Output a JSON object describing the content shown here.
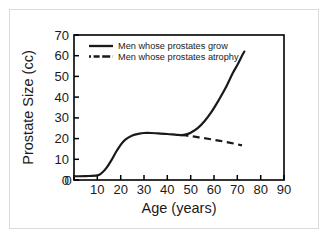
{
  "chart_data": {
    "type": "line",
    "title": "",
    "xlabel": "Age (years)",
    "ylabel": "Prostate Size (cc)",
    "xlim": [
      0,
      90
    ],
    "ylim": [
      0,
      70
    ],
    "xticks": [
      0,
      10,
      20,
      30,
      40,
      50,
      60,
      70,
      80,
      90
    ],
    "xtick_labels": [
      "0",
      "10",
      "20",
      "30",
      "40",
      "50",
      "60",
      "70",
      "80",
      "90"
    ],
    "yticks": [
      0,
      10,
      20,
      30,
      40,
      50,
      60,
      70
    ],
    "ytick_labels": [
      "0",
      "10",
      "20",
      "30",
      "40",
      "50",
      "60",
      "70"
    ],
    "grid": false,
    "legend_position": "top-left-inside",
    "series": [
      {
        "name": "Men whose prostates grow",
        "style": "solid",
        "color": "#1a1a1a",
        "x": [
          0,
          5,
          10,
          12,
          14,
          16,
          18,
          20,
          22,
          25,
          28,
          30,
          33,
          36,
          40,
          44,
          46,
          48,
          50,
          53,
          56,
          59,
          62,
          65,
          68,
          70,
          72,
          73
        ],
        "y": [
          1.8,
          1.9,
          2.2,
          3.5,
          6.0,
          9.5,
          13.5,
          17.0,
          19.5,
          21.5,
          22.4,
          22.7,
          22.7,
          22.5,
          22.2,
          21.8,
          21.7,
          22.0,
          22.8,
          25.0,
          28.5,
          33.0,
          38.5,
          44.5,
          51.5,
          55.5,
          60.0,
          62.0
        ]
      },
      {
        "name": "Men whose prostates atrophy",
        "style": "dashed",
        "color": "#1a1a1a",
        "x": [
          46,
          50,
          54,
          58,
          62,
          66,
          70,
          72
        ],
        "y": [
          21.7,
          21.2,
          20.5,
          19.8,
          19.0,
          18.2,
          17.2,
          16.7
        ]
      }
    ]
  },
  "legend": {
    "entries": [
      {
        "label": "Men whose prostates grow",
        "style": "solid"
      },
      {
        "label": "Men whose prostates atrophy",
        "style": "dash-dot"
      }
    ]
  },
  "colors": {
    "ink": "#1a1a1a",
    "frame": "#000000",
    "page_background": "#ffffff",
    "outer_border": "#d8dcdd"
  }
}
